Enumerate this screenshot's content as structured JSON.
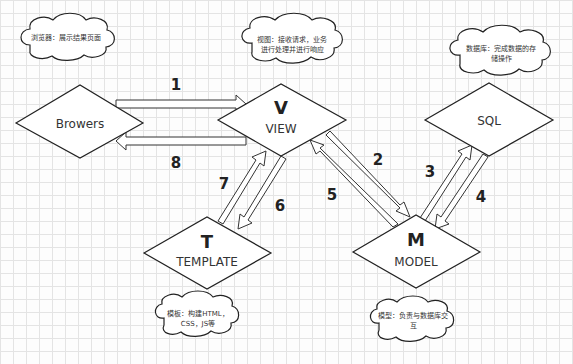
{
  "nodes": {
    "browser": {
      "label": "Browers"
    },
    "view": {
      "title": "V",
      "label": "VIEW"
    },
    "sql": {
      "label": "SQL"
    },
    "template": {
      "title": "T",
      "label": "TEMPLATE"
    },
    "model": {
      "title": "M",
      "label": "MODEL"
    }
  },
  "notes": {
    "browser": {
      "line1": "浏览器：展示结果页面"
    },
    "view": {
      "line1": "视图：接收请求，业务",
      "line2": "进行处理并进行响应"
    },
    "sql": {
      "line1": "数据库：完成数据的存",
      "line2": "储操作"
    },
    "template": {
      "line1": "模板：构建HTML，",
      "line2": "CSS，JS等"
    },
    "model": {
      "line1": "模型：负责与数据库交",
      "line2": "互"
    }
  },
  "steps": {
    "s1": "1",
    "s2": "2",
    "s3": "3",
    "s4": "4",
    "s5": "5",
    "s6": "6",
    "s7": "7",
    "s8": "8"
  },
  "colors": {
    "stroke": "#222222",
    "grid": "#e4e4e4",
    "background": "#fdfdfd"
  }
}
